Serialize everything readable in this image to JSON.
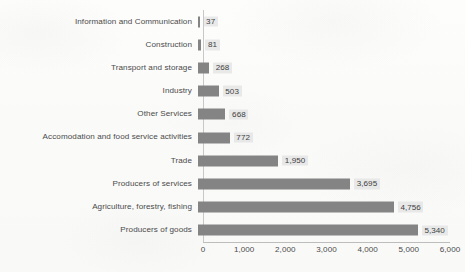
{
  "chart_data": {
    "type": "bar",
    "orientation": "horizontal",
    "title": "",
    "subtitle": "",
    "xlabel": "",
    "ylabel": "",
    "xlim": [
      0,
      6000
    ],
    "grid": false,
    "legend": false,
    "categories": [
      "Information and Communication",
      "Construction",
      "Transport and storage",
      "Industry",
      "Other Services",
      "Accomodation and food service activities",
      "Trade",
      "Producers of services",
      "Agriculture, forestry, fishing",
      "Producers of goods"
    ],
    "values": [
      37,
      81,
      268,
      503,
      668,
      772,
      1950,
      3695,
      4756,
      5340
    ],
    "value_labels": [
      "37",
      "81",
      "268",
      "503",
      "668",
      "772",
      "1,950",
      "3,695",
      "4,756",
      "5,340"
    ],
    "xticks": [
      0,
      1000,
      2000,
      3000,
      4000,
      5000,
      6000
    ],
    "xtick_labels": [
      "0",
      "1,000",
      "2,000",
      "3,000",
      "4,000",
      "5,000",
      "6,000"
    ],
    "colors": {
      "bar": "#848484",
      "label_text": "#4a4a4a",
      "value_chip": "#e4e4e4",
      "axis_line": "#c8c8c8",
      "background": "#fbfbfa"
    }
  }
}
